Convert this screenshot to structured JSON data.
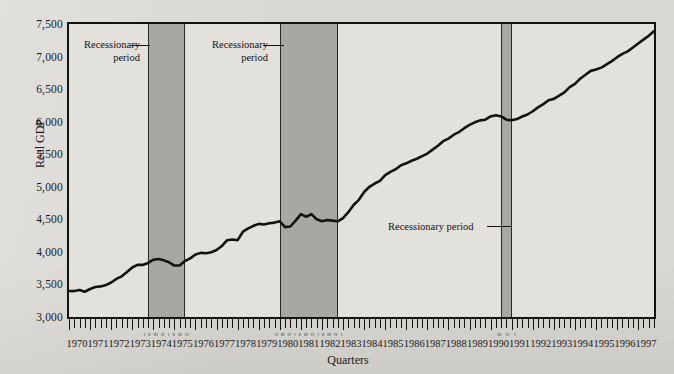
{
  "chart_data": {
    "type": "line",
    "title": "",
    "xlabel": "Quarters",
    "ylabel": "Real GDP",
    "ylim": [
      3000,
      7500
    ],
    "ytick_labels": [
      "3,000",
      "3,500",
      "4,000",
      "4,500",
      "5,000",
      "5,500",
      "6,000",
      "6,500",
      "7,000",
      "7,500"
    ],
    "ytick_values": [
      3000,
      3500,
      4000,
      4500,
      5000,
      5500,
      6000,
      6500,
      7000,
      7500
    ],
    "grid": false,
    "legend": "none",
    "xlim": [
      1970.0,
      1997.75
    ],
    "x_tick_frequency": "quarterly",
    "categories": [
      "1970",
      "1971",
      "1972",
      "1973",
      "1974",
      "1975",
      "1976",
      "1977",
      "1978",
      "1979",
      "1980",
      "1981",
      "1982",
      "1983",
      "1984",
      "1985",
      "1986",
      "1987",
      "1988",
      "1989",
      "1990",
      "1991",
      "1992",
      "1993",
      "1994",
      "1995",
      "1996",
      "1997"
    ],
    "series": [
      {
        "name": "Real GDP",
        "color": "#141210",
        "x": [
          1970.0,
          1970.25,
          1970.5,
          1970.75,
          1971.0,
          1971.25,
          1971.5,
          1971.75,
          1972.0,
          1972.25,
          1972.5,
          1972.75,
          1973.0,
          1973.25,
          1973.5,
          1973.75,
          1974.0,
          1974.25,
          1974.5,
          1974.75,
          1975.0,
          1975.25,
          1975.5,
          1975.75,
          1976.0,
          1976.25,
          1976.5,
          1976.75,
          1977.0,
          1977.25,
          1977.5,
          1977.75,
          1978.0,
          1978.25,
          1978.5,
          1978.75,
          1979.0,
          1979.25,
          1979.5,
          1979.75,
          1980.0,
          1980.25,
          1980.5,
          1980.75,
          1981.0,
          1981.25,
          1981.5,
          1981.75,
          1982.0,
          1982.25,
          1982.5,
          1982.75,
          1983.0,
          1983.25,
          1983.5,
          1983.75,
          1984.0,
          1984.25,
          1984.5,
          1984.75,
          1985.0,
          1985.25,
          1985.5,
          1985.75,
          1986.0,
          1986.25,
          1986.5,
          1986.75,
          1987.0,
          1987.25,
          1987.5,
          1987.75,
          1988.0,
          1988.25,
          1988.5,
          1988.75,
          1989.0,
          1989.25,
          1989.5,
          1989.75,
          1990.0,
          1990.25,
          1990.5,
          1990.75,
          1991.0,
          1991.25,
          1991.5,
          1991.75,
          1992.0,
          1992.25,
          1992.5,
          1992.75,
          1993.0,
          1993.25,
          1993.5,
          1993.75,
          1994.0,
          1994.25,
          1994.5,
          1994.75,
          1995.0,
          1995.25,
          1995.5,
          1995.75,
          1996.0,
          1996.25,
          1996.5,
          1996.75,
          1997.0,
          1997.25,
          1997.5,
          1997.75
        ],
        "values": [
          3400,
          3398,
          3415,
          3388,
          3430,
          3460,
          3470,
          3490,
          3530,
          3585,
          3625,
          3690,
          3760,
          3800,
          3800,
          3830,
          3880,
          3890,
          3870,
          3840,
          3790,
          3790,
          3860,
          3900,
          3960,
          3985,
          3980,
          3995,
          4030,
          4090,
          4180,
          4190,
          4180,
          4310,
          4360,
          4400,
          4430,
          4420,
          4440,
          4450,
          4470,
          4380,
          4390,
          4480,
          4580,
          4540,
          4580,
          4500,
          4470,
          4490,
          4480,
          4470,
          4520,
          4610,
          4720,
          4800,
          4920,
          5000,
          5050,
          5090,
          5180,
          5230,
          5270,
          5330,
          5360,
          5400,
          5430,
          5470,
          5510,
          5570,
          5630,
          5700,
          5740,
          5800,
          5840,
          5900,
          5950,
          5990,
          6020,
          6030,
          6080,
          6100,
          6080,
          6030,
          6020,
          6040,
          6080,
          6110,
          6160,
          6220,
          6270,
          6330,
          6350,
          6400,
          6450,
          6530,
          6580,
          6660,
          6720,
          6780,
          6800,
          6830,
          6880,
          6930,
          6990,
          7040,
          7080,
          7140,
          7200,
          7260,
          7320,
          7390
        ]
      }
    ],
    "shaded_regions": [
      {
        "label": "Recessionary period",
        "start": 1973.75,
        "end": 1975.5,
        "color": "#a9a7a2",
        "quarter_ticks": [
          "I",
          "II",
          "III",
          "IV",
          "I",
          "II",
          "III",
          "IV"
        ]
      },
      {
        "label": "Recessionary period",
        "start": 1980.0,
        "end": 1982.75,
        "color": "#a9a7a2",
        "quarter_ticks": [
          "II",
          "III",
          "IV",
          "I",
          "II",
          "III",
          "IV",
          "I",
          "II",
          "III",
          "IV",
          "I"
        ]
      },
      {
        "label": "Recessionary period",
        "start": 1990.5,
        "end": 1991.0,
        "color": "#a9a7a2",
        "quarter_ticks": [
          "III",
          "IV",
          "I"
        ]
      }
    ],
    "annotations": [
      {
        "id": "annot-1",
        "lines": [
          "Recessionary",
          "period"
        ],
        "layout": "two-line",
        "x": 84,
        "y": 38,
        "leader_from": 131,
        "leader_to": 150,
        "leader_y": 45
      },
      {
        "id": "annot-2",
        "lines": [
          "Recessionary",
          "period"
        ],
        "layout": "two-line",
        "x": 212,
        "y": 38,
        "leader_from": 263,
        "leader_to": 284,
        "leader_y": 45
      },
      {
        "id": "annot-3",
        "lines": [
          "Recessionary period"
        ],
        "layout": "one-line",
        "x": 388,
        "y": 220,
        "leader_from": 487,
        "leader_to": 512,
        "leader_y": 226
      }
    ]
  },
  "axis": {
    "y_title": "Real GDP",
    "x_title": "Quarters"
  }
}
